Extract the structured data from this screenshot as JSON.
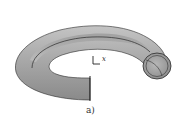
{
  "figure": {
    "caption": "a)",
    "axis_label": "x",
    "colors": {
      "surface": "#a8a8a8",
      "surface_light": "#c8c8c8",
      "surface_dark": "#7a7a7a",
      "outline": "#222222",
      "background": "#ffffff"
    }
  }
}
